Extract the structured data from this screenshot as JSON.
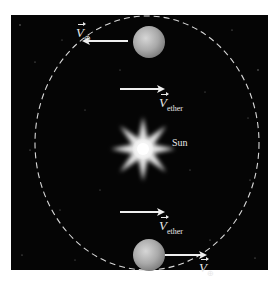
{
  "diagram": {
    "background_color": "#050505",
    "orbit_color": "#d8d8d8",
    "arrow_color": "#f0f0f0",
    "sun": {
      "label": "Sun",
      "icon": "sun-starburst-icon"
    },
    "earth_top": {
      "icon": "planet-icon",
      "velocity_label": "V",
      "velocity_subscript": "⊕",
      "direction": "left"
    },
    "earth_bottom": {
      "icon": "planet-icon",
      "velocity_label": "V",
      "velocity_subscript": "⊕",
      "direction": "right"
    },
    "ether_top": {
      "label": "V",
      "subscript": "ether",
      "direction": "right"
    },
    "ether_bottom": {
      "label": "V",
      "subscript": "ether",
      "direction": "right"
    }
  }
}
